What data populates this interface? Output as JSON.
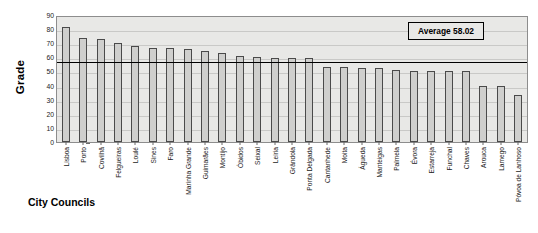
{
  "chart_data": {
    "type": "bar",
    "title": "",
    "xlabel": "City Councils",
    "ylabel": "Grade",
    "ylim": [
      0,
      90
    ],
    "ytick_step": 10,
    "yticks": [
      0,
      10,
      20,
      30,
      40,
      50,
      60,
      70,
      80,
      90
    ],
    "grid": true,
    "legend_position": "top-right",
    "annotations": [
      {
        "name": "average-line",
        "label": "Average 58.02",
        "value": 58.02
      }
    ],
    "categories": [
      "Lisboa",
      "Porto",
      "Covilhã",
      "Felgueiras",
      "Loulé",
      "Sines",
      "Faro",
      "Marinha Grande",
      "Guimarães",
      "Montijo",
      "Óbidos",
      "Seixal",
      "Leiria",
      "Grândola",
      "Ponta Delgada",
      "Cantanhede",
      "Moita",
      "Águeda",
      "Manteigas",
      "Palmela",
      "Évora",
      "Estarreja",
      "Funchal",
      "Chaves",
      "Arouca",
      "Lamego",
      "Póvoa de Lanhoso"
    ],
    "values": [
      82,
      74.5,
      73.5,
      71,
      68.5,
      67.5,
      67.5,
      66.5,
      65.5,
      64,
      61.5,
      61,
      60,
      60,
      60,
      54,
      54,
      53,
      53.5,
      51.5,
      51,
      51,
      51,
      51,
      40.5,
      40.5,
      34
    ],
    "bar_fill_color": "#cfcfcd",
    "bar_border_color": "#4a4a4a",
    "plot_background_color": "#e8e8e6",
    "average_line_color": "#000000"
  },
  "axis": {
    "y_title": "Grade",
    "x_title": "City Councils"
  },
  "legend": {
    "average_label": "Average 58.02"
  }
}
